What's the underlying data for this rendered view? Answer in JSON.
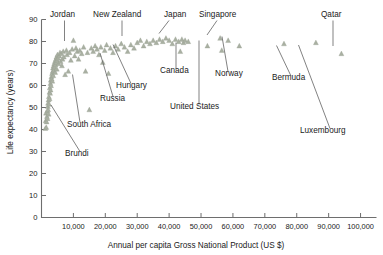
{
  "chart_data": {
    "type": "scatter",
    "title": "",
    "xlabel": "Annual per capita Gross National Product (US $)",
    "ylabel": "Life expectancy (years)",
    "xlim": [
      0,
      105000
    ],
    "ylim": [
      0,
      90
    ],
    "grid": false,
    "legend": "none",
    "marker": "triangle",
    "marker_color": "#a9b0a2",
    "xticks": [
      10000,
      20000,
      30000,
      40000,
      50000,
      60000,
      70000,
      80000,
      90000,
      100000
    ],
    "xtick_labels": [
      "10,000",
      "20,000",
      "30,000",
      "40,000",
      "50,000",
      "60,000",
      "70,000",
      "80,000",
      "90,000",
      "100,000"
    ],
    "yticks": [
      0,
      10,
      20,
      30,
      40,
      50,
      60,
      70,
      80,
      90
    ],
    "ytick_labels": [
      "0",
      "10",
      "20",
      "30",
      "40",
      "50",
      "60",
      "70",
      "80",
      "90"
    ],
    "points": [
      [
        1200,
        40.5
      ],
      [
        1300,
        44.0
      ],
      [
        1400,
        47.5
      ],
      [
        1500,
        41.0
      ],
      [
        1600,
        43.5
      ],
      [
        1700,
        46.0
      ],
      [
        1800,
        48.5
      ],
      [
        1900,
        45.0
      ],
      [
        2000,
        50.5
      ],
      [
        2050,
        52.0
      ],
      [
        2100,
        49.0
      ],
      [
        2200,
        53.5
      ],
      [
        2250,
        47.0
      ],
      [
        2300,
        55.0
      ],
      [
        2400,
        51.5
      ],
      [
        2500,
        57.0
      ],
      [
        2550,
        54.0
      ],
      [
        2600,
        59.0
      ],
      [
        2700,
        56.5
      ],
      [
        2800,
        61.0
      ],
      [
        2850,
        58.0
      ],
      [
        2900,
        62.5
      ],
      [
        3000,
        60.0
      ],
      [
        3100,
        64.0
      ],
      [
        3200,
        63.0
      ],
      [
        3300,
        65.5
      ],
      [
        3400,
        62.0
      ],
      [
        3500,
        66.5
      ],
      [
        3600,
        68.0
      ],
      [
        3700,
        64.5
      ],
      [
        3800,
        69.0
      ],
      [
        3900,
        67.0
      ],
      [
        4000,
        70.0
      ],
      [
        4100,
        68.5
      ],
      [
        4200,
        71.0
      ],
      [
        4300,
        66.0
      ],
      [
        4400,
        69.5
      ],
      [
        4500,
        72.0
      ],
      [
        4600,
        70.5
      ],
      [
        4700,
        73.0
      ],
      [
        4800,
        67.5
      ],
      [
        4900,
        71.5
      ],
      [
        5000,
        74.0
      ],
      [
        5200,
        72.5
      ],
      [
        5400,
        70.0
      ],
      [
        5600,
        73.5
      ],
      [
        5800,
        75.0
      ],
      [
        6000,
        71.0
      ],
      [
        6200,
        74.5
      ],
      [
        6400,
        69.0
      ],
      [
        6600,
        72.0
      ],
      [
        6800,
        75.5
      ],
      [
        7000,
        73.0
      ],
      [
        7400,
        65.0
      ],
      [
        7800,
        76.0
      ],
      [
        8000,
        74.0
      ],
      [
        8400,
        66.5
      ],
      [
        8800,
        75.0
      ],
      [
        9200,
        71.5
      ],
      [
        9600,
        76.5
      ],
      [
        10000,
        80.5
      ],
      [
        10400,
        73.5
      ],
      [
        10800,
        77.0
      ],
      [
        11200,
        75.5
      ],
      [
        11600,
        72.0
      ],
      [
        12000,
        76.0
      ],
      [
        12600,
        74.5
      ],
      [
        13200,
        77.5
      ],
      [
        13800,
        66.5
      ],
      [
        14400,
        75.0
      ],
      [
        15000,
        49.0
      ],
      [
        15600,
        77.0
      ],
      [
        16200,
        75.5
      ],
      [
        16800,
        78.0
      ],
      [
        17400,
        76.5
      ],
      [
        18000,
        74.0
      ],
      [
        18600,
        77.5
      ],
      [
        19200,
        70.5
      ],
      [
        19800,
        76.0
      ],
      [
        20400,
        78.5
      ],
      [
        21000,
        65.5
      ],
      [
        21600,
        77.0
      ],
      [
        22400,
        75.0
      ],
      [
        23200,
        78.0
      ],
      [
        24000,
        76.5
      ],
      [
        25000,
        79.0
      ],
      [
        26000,
        77.5
      ],
      [
        27000,
        75.5
      ],
      [
        28000,
        78.5
      ],
      [
        29000,
        77.0
      ],
      [
        30000,
        79.5
      ],
      [
        31000,
        80.5
      ],
      [
        32000,
        78.0
      ],
      [
        33000,
        80.0
      ],
      [
        34000,
        79.0
      ],
      [
        35000,
        80.5
      ],
      [
        36000,
        79.5
      ],
      [
        37000,
        81.0
      ],
      [
        38000,
        80.0
      ],
      [
        39000,
        81.5
      ],
      [
        40000,
        80.5
      ],
      [
        41000,
        79.0
      ],
      [
        42000,
        81.0
      ],
      [
        43000,
        80.0
      ],
      [
        43500,
        75.5
      ],
      [
        44000,
        81.0
      ],
      [
        44500,
        79.5
      ],
      [
        45000,
        80.5
      ],
      [
        46000,
        80.0
      ],
      [
        52000,
        78.0
      ],
      [
        56000,
        81.5
      ],
      [
        56500,
        76.0
      ],
      [
        58500,
        80.5
      ],
      [
        62000,
        78.0
      ],
      [
        76000,
        79.0
      ],
      [
        86000,
        79.5
      ],
      [
        94000,
        74.5
      ]
    ],
    "annotations": [
      {
        "name": "jordan",
        "label": "Jordan",
        "label_x": 50,
        "label_y": 17,
        "anchor": "start",
        "leader": [
          [
            64.5,
            20.5
          ],
          [
            64.5,
            41.0
          ]
        ]
      },
      {
        "name": "new-zealand",
        "label": "New Zealand",
        "label_x": 93,
        "label_y": 17,
        "anchor": "start",
        "leader": [
          [
            122.0,
            20.5
          ],
          [
            122.0,
            36.0
          ]
        ]
      },
      {
        "name": "japan",
        "label": "Japan",
        "label_x": 164,
        "label_y": 17,
        "anchor": "start",
        "leader": [
          [
            169.0,
            20.5
          ],
          [
            159.0,
            33.5
          ]
        ]
      },
      {
        "name": "singapore",
        "label": "Singapore",
        "label_x": 199,
        "label_y": 17,
        "anchor": "start",
        "leader": [
          [
            217.0,
            20.5
          ],
          [
            207.0,
            35.0
          ]
        ]
      },
      {
        "name": "qatar",
        "label": "Qatar",
        "label_x": 321,
        "label_y": 17,
        "anchor": "start",
        "leader": [
          [
            333.0,
            20.5
          ],
          [
            333.0,
            46.0
          ]
        ]
      },
      {
        "name": "canada",
        "label": "Canada",
        "label_x": 160,
        "label_y": 73,
        "anchor": "start",
        "leader": [
          [
            176.0,
            69.5
          ],
          [
            176.0,
            42.5
          ]
        ]
      },
      {
        "name": "norway",
        "label": "Norway",
        "label_x": 215,
        "label_y": 76,
        "anchor": "start",
        "leader": [
          [
            228.0,
            71.5
          ],
          [
            222.0,
            36.5
          ]
        ]
      },
      {
        "name": "bermuda",
        "label": "Bermuda",
        "label_x": 272,
        "label_y": 80,
        "anchor": "start",
        "leader": [
          [
            291.0,
            76.0
          ],
          [
            276.5,
            45.5
          ]
        ]
      },
      {
        "name": "hungary",
        "label": "Hungary",
        "label_x": 116,
        "label_y": 88,
        "anchor": "start",
        "leader": [
          [
            131.0,
            83.5
          ],
          [
            113.0,
            44.5
          ]
        ]
      },
      {
        "name": "russia",
        "label": "Russia",
        "label_x": 100,
        "label_y": 101,
        "anchor": "start",
        "leader": [
          [
            113.0,
            96.5
          ],
          [
            100.0,
            53.0
          ]
        ]
      },
      {
        "name": "united-states",
        "label": "United States",
        "label_x": 170,
        "label_y": 109,
        "anchor": "start",
        "leader": [
          [
            199.0,
            104.5
          ],
          [
            199.0,
            40.5
          ]
        ]
      },
      {
        "name": "luxembourg",
        "label": "Luxembourg",
        "label_x": 300,
        "label_y": 133,
        "anchor": "start",
        "leader": [
          [
            330.0,
            128.5
          ],
          [
            298.5,
            45.0
          ]
        ]
      },
      {
        "name": "south-africa",
        "label": "South Africa",
        "label_x": 67,
        "label_y": 127,
        "anchor": "start",
        "leader": [
          [
            80.0,
            122.5
          ],
          [
            72.5,
            74.5
          ]
        ]
      },
      {
        "name": "brundi",
        "label": "Brundi",
        "label_x": 65,
        "label_y": 156,
        "anchor": "start",
        "leader": [
          [
            80.0,
            151.5
          ],
          [
            51.0,
            105.0
          ]
        ]
      }
    ]
  }
}
